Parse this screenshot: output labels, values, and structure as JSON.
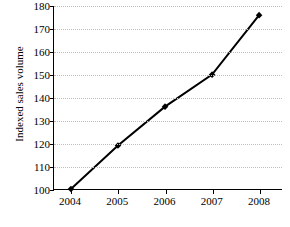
{
  "chart_data": {
    "type": "line",
    "title": "",
    "xlabel": "",
    "ylabel": "Indexed sales volume",
    "categories": [
      "2004",
      "2005",
      "2006",
      "2007",
      "2008"
    ],
    "values": [
      100,
      119,
      136,
      150,
      176
    ],
    "series": [
      {
        "name": "Indexed sales volume",
        "values": [
          100,
          119,
          136,
          150,
          176
        ]
      }
    ],
    "ylim": [
      100,
      180
    ],
    "yticks": [
      100,
      110,
      120,
      130,
      140,
      150,
      160,
      170,
      180
    ],
    "ytick_labels": [
      "100",
      "110",
      "120",
      "130",
      "140",
      "150",
      "160",
      "170",
      "180"
    ],
    "xlim": [
      "2004",
      "2008"
    ],
    "grid": "horizontal-dotted",
    "legend": "none",
    "marker": "filled-diamond",
    "line_color": "#000000",
    "grid_color": "#bdbdbd",
    "axis_color": "#000000",
    "background": "#ffffff"
  },
  "caption": {
    "text": ""
  }
}
